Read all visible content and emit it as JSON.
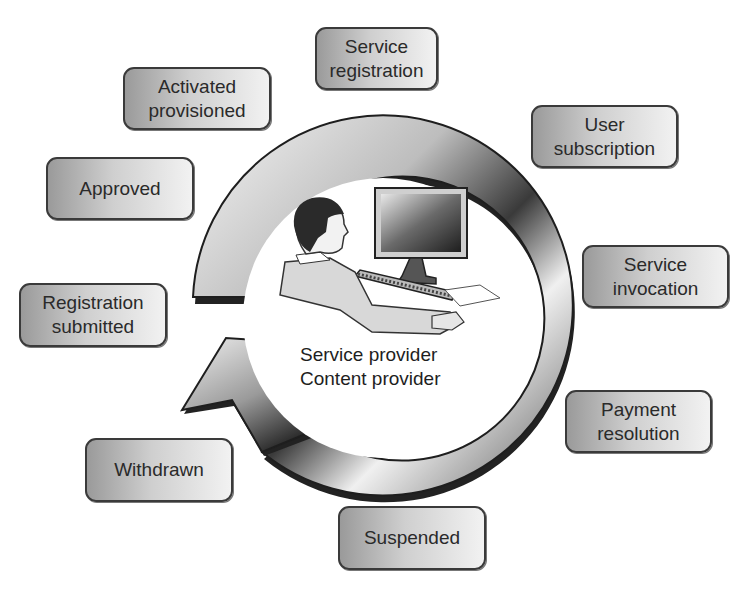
{
  "diagram": {
    "center": {
      "label": "Service provider\nContent provider",
      "illustration": "person-at-computer"
    },
    "cycle_arrow": {
      "direction": "clockwise",
      "style": "gray-gradient-ring"
    },
    "stages": [
      {
        "id": "service-registration",
        "label": "Service\nregistration",
        "x": 315,
        "y": 27,
        "w": 123,
        "h": 63
      },
      {
        "id": "user-subscription",
        "label": "User\nsubscription",
        "x": 531,
        "y": 105,
        "w": 147,
        "h": 63
      },
      {
        "id": "service-invocation",
        "label": "Service\ninvocation",
        "x": 582,
        "y": 245,
        "w": 147,
        "h": 63
      },
      {
        "id": "payment-resolution",
        "label": "Payment\nresolution",
        "x": 565,
        "y": 390,
        "w": 147,
        "h": 63
      },
      {
        "id": "suspended",
        "label": "Suspended",
        "x": 338,
        "y": 506,
        "w": 148,
        "h": 64
      },
      {
        "id": "withdrawn",
        "label": "Withdrawn",
        "x": 85,
        "y": 438,
        "w": 148,
        "h": 64
      },
      {
        "id": "registration-submitted",
        "label": "Registration\nsubmitted",
        "x": 19,
        "y": 283,
        "w": 148,
        "h": 64
      },
      {
        "id": "approved",
        "label": "Approved",
        "x": 46,
        "y": 157,
        "w": 148,
        "h": 63
      },
      {
        "id": "activated-provisioned",
        "label": "Activated\nprovisioned",
        "x": 123,
        "y": 67,
        "w": 148,
        "h": 63
      }
    ],
    "colors": {
      "box_border": "#3a3a3a",
      "box_fill_dark": "#9a9a9a",
      "box_fill_light": "#f2f2f2",
      "ring_dark": "#2a2a2a",
      "ring_light": "#f4f4f4",
      "text": "#2a2a2a"
    }
  }
}
